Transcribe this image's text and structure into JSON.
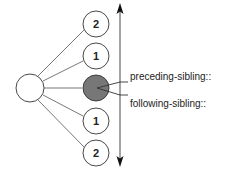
{
  "diagram": {
    "type": "xpath-sibling-axes",
    "root_node": {
      "label": "",
      "fill": "#ffffff"
    },
    "sibling_nodes": [
      {
        "label": "2",
        "fill": "#ffffff",
        "position": "preceding"
      },
      {
        "label": "1",
        "fill": "#ffffff",
        "position": "preceding"
      },
      {
        "label": "",
        "fill": "#777777",
        "position": "context"
      },
      {
        "label": "1",
        "fill": "#ffffff",
        "position": "following"
      },
      {
        "label": "2",
        "fill": "#ffffff",
        "position": "following"
      }
    ],
    "axes": [
      {
        "label": "preceding-sibling::",
        "direction": "up"
      },
      {
        "label": "following-sibling::",
        "direction": "down"
      }
    ],
    "colors": {
      "stroke": "#333333",
      "edge": "#555555",
      "context_fill": "#777777",
      "background": "#ffffff"
    }
  }
}
